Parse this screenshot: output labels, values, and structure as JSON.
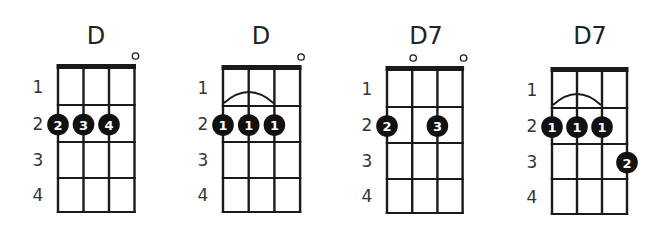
{
  "colors": {
    "ink": "#1a1a1a",
    "text": "#222222",
    "dot": "#111111",
    "dot_text": "#ffffff",
    "background": "#ffffff"
  },
  "fret_labels": [
    "1",
    "2",
    "3",
    "4"
  ],
  "chords": [
    {
      "name": "D",
      "title_x": 96,
      "left_x": 58,
      "string_spacing": 25.5,
      "nut_y": 64,
      "fret_ys": [
        105,
        142,
        178,
        212
      ],
      "open_strings": [
        {
          "string": 4,
          "symbol": "o"
        }
      ],
      "barre": null,
      "fingers": [
        {
          "string": 1,
          "fret": 2,
          "finger": "2"
        },
        {
          "string": 2,
          "fret": 2,
          "finger": "3"
        },
        {
          "string": 3,
          "fret": 2,
          "finger": "4"
        }
      ]
    },
    {
      "name": "D",
      "title_x": 261,
      "left_x": 223,
      "string_spacing": 25.7,
      "nut_y": 65,
      "fret_ys": [
        106,
        142,
        178,
        212
      ],
      "open_strings": [
        {
          "string": 4,
          "symbol": "o"
        }
      ],
      "barre": {
        "from_string": 1,
        "to_string": 3,
        "fret": 2
      },
      "fingers": [
        {
          "string": 1,
          "fret": 2,
          "finger": "1"
        },
        {
          "string": 2,
          "fret": 2,
          "finger": "1"
        },
        {
          "string": 3,
          "fret": 2,
          "finger": "1"
        }
      ]
    },
    {
      "name": "D7",
      "title_x": 426,
      "left_x": 387,
      "string_spacing": 25.2,
      "nut_y": 66,
      "fret_ys": [
        107,
        143,
        179,
        213
      ],
      "open_strings": [
        {
          "string": 2,
          "symbol": "o"
        },
        {
          "string": 4,
          "symbol": "o"
        }
      ],
      "barre": null,
      "fingers": [
        {
          "string": 1,
          "fret": 2,
          "finger": "2"
        },
        {
          "string": 3,
          "fret": 2,
          "finger": "3"
        }
      ]
    },
    {
      "name": "D7",
      "title_x": 590,
      "left_x": 552,
      "string_spacing": 25.0,
      "nut_y": 67,
      "fret_ys": [
        108,
        144,
        179,
        214
      ],
      "open_strings": [],
      "barre": {
        "from_string": 1,
        "to_string": 3,
        "fret": 2
      },
      "fingers": [
        {
          "string": 1,
          "fret": 2,
          "finger": "1"
        },
        {
          "string": 2,
          "fret": 2,
          "finger": "1"
        },
        {
          "string": 3,
          "fret": 2,
          "finger": "1"
        },
        {
          "string": 4,
          "fret": 3,
          "finger": "2"
        }
      ]
    }
  ]
}
